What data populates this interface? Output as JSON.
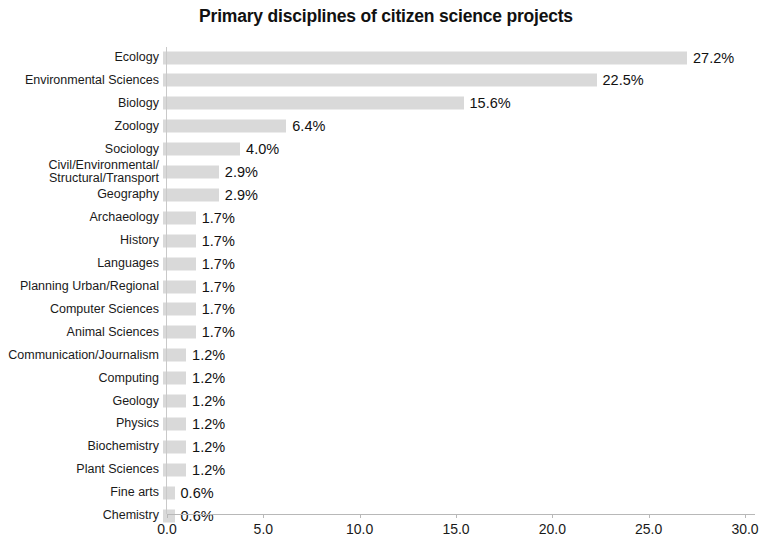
{
  "chart_data": {
    "type": "bar",
    "orientation": "horizontal",
    "title": "Primary disciplines of citizen science projects",
    "xlabel": "",
    "ylabel": "",
    "xlim": [
      0,
      30
    ],
    "xticks": [
      "0.0",
      "5.0",
      "10.0",
      "15.0",
      "20.0",
      "25.0",
      "30.0"
    ],
    "xtick_values": [
      0,
      5,
      10,
      15,
      20,
      25,
      30
    ],
    "grid": false,
    "legend": false,
    "bar_color": "#d9d9d9",
    "categories": [
      "Ecology",
      "Environmental Sciences",
      "Biology",
      "Zoology",
      "Sociology",
      "Civil/Environmental/\nStructural/Transport",
      "Geography",
      "Archaeology",
      "History",
      "Languages",
      "Planning Urban/Regional",
      "Computer Sciences",
      "Animal Sciences",
      "Communication/Journalism",
      "Computing",
      "Geology",
      "Physics",
      "Biochemistry",
      "Plant Sciences",
      "Fine arts",
      "Chemistry"
    ],
    "values": [
      27.2,
      22.5,
      15.6,
      6.4,
      4.0,
      2.9,
      2.9,
      1.7,
      1.7,
      1.7,
      1.7,
      1.7,
      1.7,
      1.2,
      1.2,
      1.2,
      1.2,
      1.2,
      1.2,
      0.6,
      0.6
    ],
    "value_labels": [
      "27.2%",
      "22.5%",
      "15.6%",
      "6.4%",
      "4.0%",
      "2.9%",
      "2.9%",
      "1.7%",
      "1.7%",
      "1.7%",
      "1.7%",
      "1.7%",
      "1.7%",
      "1.2%",
      "1.2%",
      "1.2%",
      "1.2%",
      "1.2%",
      "1.2%",
      "0.6%",
      "0.6%"
    ]
  }
}
